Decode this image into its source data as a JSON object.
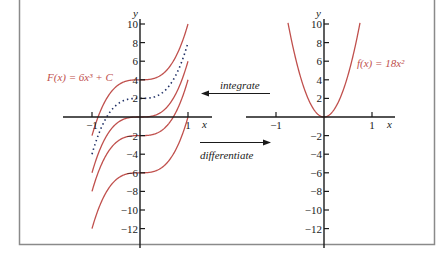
{
  "figure": {
    "curve_color": "#c0504d",
    "axis_color": "#1a1a1a",
    "frame_color": "#8a8a8a"
  },
  "left_graph": {
    "y_axis_label": "y",
    "x_axis_label": "x",
    "y_ticks": [
      10,
      8,
      6,
      4,
      2,
      -2,
      -4,
      -6,
      -8,
      -10,
      -12
    ],
    "y_tick_labels": [
      "10",
      "8",
      "6",
      "4",
      "2",
      "−2",
      "−4",
      "−6",
      "−8",
      "−10",
      "−12"
    ],
    "x_ticks": [
      -1,
      1
    ],
    "x_tick_labels": [
      "−1",
      "1"
    ],
    "function_label": "F(x) = 6x³ + C",
    "constants_solid": [
      4,
      0,
      -2,
      -6
    ],
    "constant_dotted": 2
  },
  "right_graph": {
    "y_axis_label": "y",
    "x_axis_label": "x",
    "y_ticks": [
      10,
      8,
      6,
      4,
      2,
      -2,
      -4,
      -6,
      -8,
      -10,
      -12
    ],
    "y_tick_labels": [
      "10",
      "8",
      "6",
      "4",
      "2",
      "−2",
      "−4",
      "−6",
      "−8",
      "−10",
      "−12"
    ],
    "x_ticks": [
      -1,
      1
    ],
    "x_tick_labels": [
      "−1",
      "1"
    ],
    "function_label": "f(x) = 18x²"
  },
  "arrows": {
    "integrate_label": "integrate",
    "differentiate_label": "differentiate"
  },
  "chart_data": [
    {
      "type": "line",
      "title": "F(x) = 6x³ + C",
      "xlabel": "x",
      "ylabel": "y",
      "xlim": [
        -1,
        1
      ],
      "ylim": [
        -12,
        10
      ],
      "x_ticks": [
        -1,
        1
      ],
      "y_ticks": [
        -12,
        -10,
        -8,
        -6,
        -4,
        -2,
        2,
        4,
        6,
        8,
        10
      ],
      "series": [
        {
          "name": "C = 4",
          "style": "solid",
          "formula": "6x^3 + 4"
        },
        {
          "name": "C = 2",
          "style": "dotted",
          "formula": "6x^3 + 2"
        },
        {
          "name": "C = 0",
          "style": "solid",
          "formula": "6x^3"
        },
        {
          "name": "C = -2",
          "style": "solid",
          "formula": "6x^3 - 2"
        },
        {
          "name": "C = -6",
          "style": "solid",
          "formula": "6x^3 - 6"
        }
      ],
      "grid": false
    },
    {
      "type": "line",
      "title": "f(x) = 18x²",
      "xlabel": "x",
      "ylabel": "y",
      "xlim": [
        -1,
        1
      ],
      "ylim": [
        -12,
        10
      ],
      "x_ticks": [
        -1,
        1
      ],
      "y_ticks": [
        -12,
        -10,
        -8,
        -6,
        -4,
        -2,
        2,
        4,
        6,
        8,
        10
      ],
      "series": [
        {
          "name": "f(x) = 18x²",
          "style": "solid",
          "formula": "18x^2"
        }
      ],
      "grid": false
    }
  ],
  "annotations": [
    "integrate",
    "differentiate"
  ]
}
